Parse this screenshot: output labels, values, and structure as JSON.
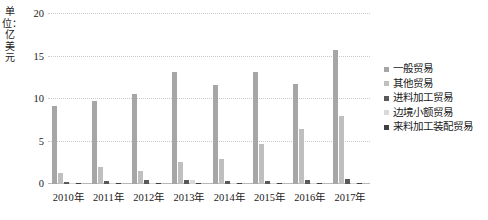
{
  "chart_data": {
    "type": "bar",
    "title": "",
    "subtitle": "",
    "xlabel": "",
    "ylabel": "单位：亿美元",
    "ylim": [
      0,
      20
    ],
    "yticks": [
      0,
      5,
      10,
      15,
      20
    ],
    "ytick_labels": [
      "0",
      "5",
      "10",
      "15",
      "20"
    ],
    "grid": true,
    "grid_axis": "y",
    "legend_position": "right",
    "categories": [
      "2010年",
      "2011年",
      "2012年",
      "2013年",
      "2014年",
      "2015年",
      "2016年",
      "2017年"
    ],
    "series": [
      {
        "name": "一般贸易",
        "color": "#a6a6a6",
        "values": [
          9.2,
          9.8,
          10.6,
          13.2,
          11.7,
          13.2,
          11.8,
          15.8
        ]
      },
      {
        "name": "其他贸易",
        "color": "#bfbfbf",
        "values": [
          1.3,
          2.0,
          1.5,
          2.6,
          3.0,
          4.7,
          6.5,
          8.0
        ]
      },
      {
        "name": "进料加工贸易",
        "color": "#595959",
        "values": [
          0.25,
          0.3,
          0.45,
          0.5,
          0.4,
          0.4,
          0.45,
          0.55
        ]
      },
      {
        "name": "边境小额贸易",
        "color": "#d9d9d9",
        "values": [
          0.05,
          0.05,
          0.05,
          0.45,
          0.05,
          0.05,
          0.05,
          0.05
        ]
      },
      {
        "name": "来料加工装配贸易",
        "color": "#404040",
        "values": [
          0.1,
          0.1,
          0.1,
          0.1,
          0.1,
          0.1,
          0.1,
          0.1
        ]
      }
    ]
  },
  "colors": {
    "gridline": "#c9c9c9",
    "axis": "#b9b9b9",
    "text": "#1a1a1a",
    "background": "#ffffff"
  }
}
